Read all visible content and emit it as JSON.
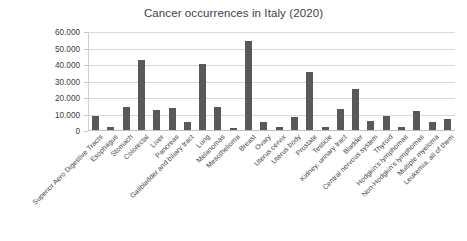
{
  "chart_data": {
    "type": "bar",
    "title": "Cancer occurrences in Italy (2020)",
    "xlabel": "",
    "ylabel": "",
    "ylim": [
      0,
      60000
    ],
    "ytick_labels": [
      "60.000",
      "50.000",
      "40.000",
      "30.000",
      "20.000",
      "10.000",
      "0"
    ],
    "ytick_values": [
      60000,
      50000,
      40000,
      30000,
      20000,
      10000,
      0
    ],
    "grid": true,
    "legend": "none",
    "bar_color": "#595959",
    "gridline_color": "#d9d9d9",
    "categories": [
      "Superior Aero Digestive Tracts",
      "Esophagus",
      "Stomach",
      "Colorectal",
      "Liver",
      "Pancreas",
      "Gallbladder and biliary tract",
      "Lung",
      "Melanomas",
      "Mesothelioma",
      "Breast",
      "Ovary",
      "Uterus cervix",
      "Uterus body",
      "Prostate",
      "Testicle",
      "Kidney, urinary tract",
      "Bladder",
      "Central nervous system",
      "Thyroid",
      "Hodgkin's lymphomas",
      "Non-Hodgkin's lymphomas",
      "Multiple myeloma",
      "Leukemia, all of them"
    ],
    "values": [
      9000,
      2300,
      14700,
      43300,
      12800,
      14100,
      5300,
      40500,
      14500,
      1900,
      54500,
      5200,
      2400,
      8300,
      36000,
      2200,
      13500,
      25500,
      6200,
      8800,
      2150,
      12000,
      5700,
      7000
    ]
  }
}
